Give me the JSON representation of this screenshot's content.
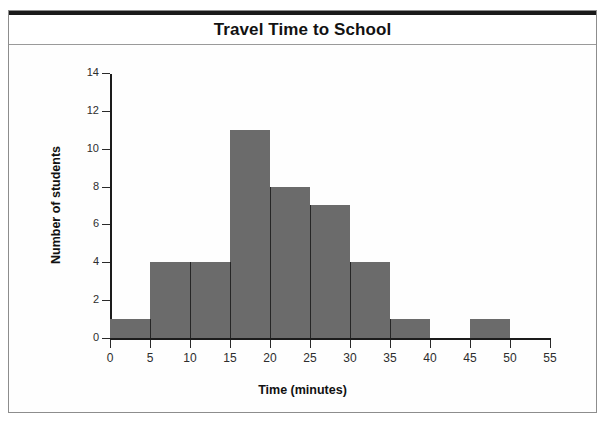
{
  "figure": {
    "title": "Travel Time to School",
    "background_color": "#ffffff",
    "frame_color": "#8d8d8d",
    "bar_color": "#6b6b6b",
    "axis_color": "#1c1c1c"
  },
  "chart_data": {
    "type": "bar",
    "title": "Travel Time to School",
    "xlabel": "Time (minutes)",
    "ylabel": "Number of students",
    "xlim": [
      0,
      55
    ],
    "ylim": [
      0,
      14
    ],
    "xtick_labels": [
      "0",
      "5",
      "10",
      "15",
      "20",
      "25",
      "30",
      "35",
      "40",
      "45",
      "50",
      "55"
    ],
    "xticks": [
      0,
      5,
      10,
      15,
      20,
      25,
      30,
      35,
      40,
      45,
      50,
      55
    ],
    "ytick_labels": [
      "0",
      "2",
      "4",
      "6",
      "8",
      "10",
      "12",
      "14"
    ],
    "yticks": [
      0,
      2,
      4,
      6,
      8,
      10,
      12,
      14
    ],
    "grid": false,
    "legend": null,
    "bin_width": 5,
    "bin_edges": [
      0,
      5,
      10,
      15,
      20,
      25,
      30,
      35,
      40,
      45,
      50,
      55
    ],
    "categories": [
      "0-5",
      "5-10",
      "10-15",
      "15-20",
      "20-25",
      "25-30",
      "30-35",
      "35-40",
      "40-45",
      "45-50",
      "50-55"
    ],
    "values": [
      1,
      4,
      4,
      11,
      8,
      7,
      4,
      1,
      0,
      1,
      0
    ],
    "bars": [
      {
        "label": "0-5",
        "start": 0,
        "end": 5,
        "value": 1
      },
      {
        "label": "5-10",
        "start": 5,
        "end": 10,
        "value": 4
      },
      {
        "label": "10-15",
        "start": 10,
        "end": 15,
        "value": 4
      },
      {
        "label": "15-20",
        "start": 15,
        "end": 20,
        "value": 11
      },
      {
        "label": "20-25",
        "start": 20,
        "end": 25,
        "value": 8
      },
      {
        "label": "25-30",
        "start": 25,
        "end": 30,
        "value": 7
      },
      {
        "label": "30-35",
        "start": 30,
        "end": 35,
        "value": 4
      },
      {
        "label": "35-40",
        "start": 35,
        "end": 40,
        "value": 1
      },
      {
        "label": "40-45",
        "start": 40,
        "end": 45,
        "value": 0
      },
      {
        "label": "45-50",
        "start": 45,
        "end": 50,
        "value": 1
      },
      {
        "label": "50-55",
        "start": 50,
        "end": 55,
        "value": 0
      }
    ]
  }
}
